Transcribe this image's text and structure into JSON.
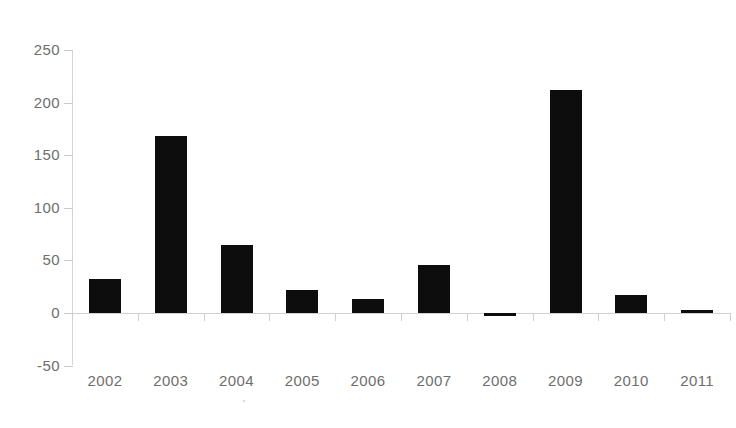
{
  "chart_data": {
    "type": "bar",
    "title": "",
    "subtitle": "",
    "xlabel": "",
    "ylabel": "",
    "categories": [
      "2002",
      "2003",
      "2004",
      "2005",
      "2006",
      "2007",
      "2008",
      "2009",
      "2010",
      "2011"
    ],
    "values": [
      32,
      168,
      65,
      22,
      13,
      46,
      -3,
      212,
      17,
      3
    ],
    "y_ticks": [
      250,
      200,
      150,
      100,
      50,
      0,
      -50
    ],
    "ylim": [
      -50,
      250
    ],
    "grid": false,
    "legend": false,
    "bar_color": "#0d0d0d",
    "axis_color": "#d0d0d0",
    "tick_label_color": "#6e6e6e"
  },
  "axis": {
    "y_tick_labels": [
      "250",
      "200",
      "150",
      "100",
      "50",
      "0",
      "-50"
    ],
    "x_tick_labels": [
      "2002",
      "2003",
      "2004",
      "2005",
      "2006",
      "2007",
      "2008",
      "2009",
      "2010",
      "2011"
    ]
  }
}
